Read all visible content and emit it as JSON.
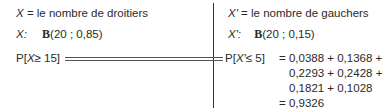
{
  "left": {
    "definition_var": "X",
    "definition_text": "= le nombre de droitiers",
    "law_var": "X:",
    "law_symbol": "B",
    "law_params": "(20 ; 0,85)",
    "prob_prefix": "P[",
    "prob_var": "X",
    "prob_rel": "≥ 15]"
  },
  "right": {
    "definition_var": "X'",
    "definition_text": "= le nombre de gauchers",
    "law_var": "X':",
    "law_symbol": "B",
    "law_params": "(20 ; 0,15)",
    "prob_prefix": "P[",
    "prob_var": "X'",
    "prob_rel": "≤ 5]",
    "eq_lines": [
      "= 0,0388 + 0,1368 +",
      "0,2293 + 0,2428 +",
      "0,1821 + 0,1028",
      "= 0,9326"
    ]
  }
}
